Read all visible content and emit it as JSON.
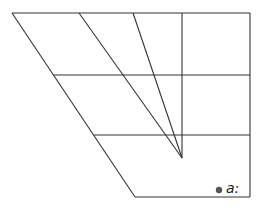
{
  "diagram": {
    "type": "vowel-trapezoid",
    "colors": {
      "line": "#333333",
      "dot": "#555555",
      "label": "#222222"
    },
    "outline": {
      "top": {
        "x1": 12,
        "y1": 13,
        "x2": 250,
        "y2": 13
      },
      "left": {
        "x1": 12,
        "y1": 13,
        "x2": 135,
        "y2": 197
      },
      "right": {
        "x1": 250,
        "y1": 13,
        "x2": 250,
        "y2": 197
      },
      "bottom": {
        "x1": 135,
        "y1": 197,
        "x2": 250,
        "y2": 197
      }
    },
    "horizontals": [
      {
        "x1": 53,
        "y1": 75,
        "x2": 250,
        "y2": 75
      },
      {
        "x1": 94,
        "y1": 135,
        "x2": 250,
        "y2": 135
      }
    ],
    "center_vertical": {
      "x1": 182,
      "y1": 13,
      "x2": 182,
      "y2": 158
    },
    "converging_lines": [
      {
        "x1": 79,
        "y1": 13,
        "x2": 182,
        "y2": 158
      },
      {
        "x1": 133,
        "y1": 13,
        "x2": 182,
        "y2": 158
      }
    ],
    "vowels": [
      {
        "symbol": "a:",
        "dot": {
          "cx": 219,
          "cy": 190,
          "r": 3.2
        },
        "label_pos": {
          "x": 226,
          "y": 193
        }
      }
    ]
  }
}
